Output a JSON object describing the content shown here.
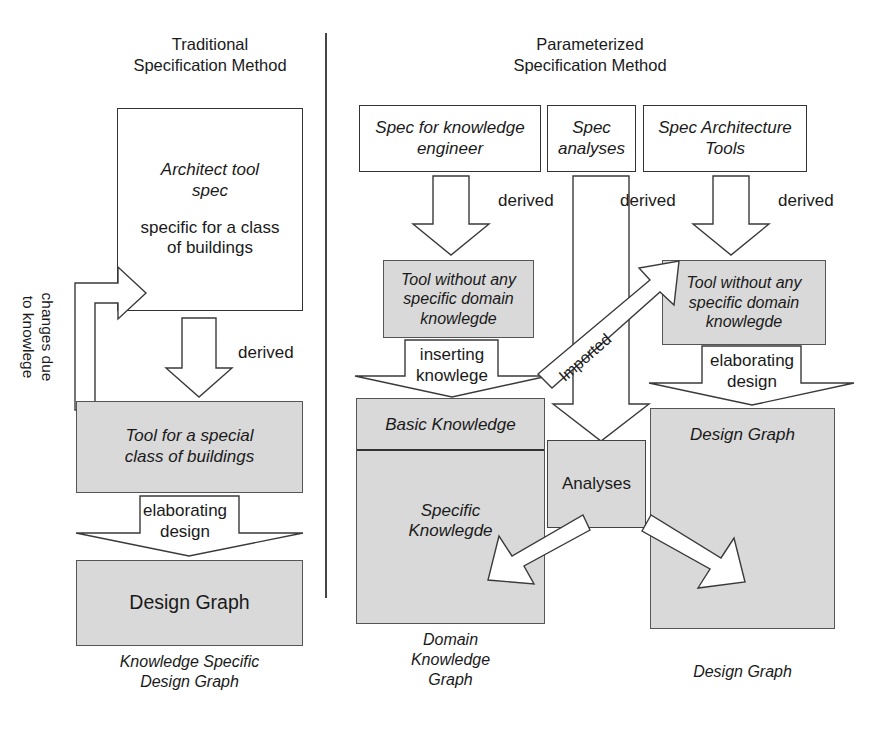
{
  "diagram": {
    "title_left": "Traditional\nSpecification Method",
    "title_right": "Parameterized\nSpecification Method",
    "colors": {
      "fill_gray": "#d9d9d9",
      "stroke": "#333333",
      "background": "#ffffff"
    }
  },
  "left_column": {
    "heading": "Traditional\nSpecification Method",
    "spec_box": {
      "line1": "Architect tool",
      "line2": "spec",
      "line3": "specific for a class",
      "line4": "of buildings"
    },
    "feedback_arrow_label": "changes due\nto knowlege",
    "derived_label": "derived",
    "tool_box": {
      "line1": "Tool for a special",
      "line2": "class of buildings"
    },
    "elaborating_label": "elaborating\ndesign",
    "design_graph_box": "Design Graph",
    "caption": "Knowledge Specific\nDesign Graph"
  },
  "right_column": {
    "heading": "Parameterized\nSpecification Method",
    "spec_boxes": [
      {
        "line1": "Spec for knowledge",
        "line2": "engineer"
      },
      {
        "line1": "Spec",
        "line2": "analyses"
      },
      {
        "line1": "Spec Architecture",
        "line2": "Tools"
      }
    ],
    "derived_labels": [
      "derived",
      "derived",
      "derived"
    ],
    "tool_box_left": {
      "line1": "Tool without any",
      "line2": "specific domain",
      "line3": "knowlegde"
    },
    "tool_box_right": {
      "line1": "Tool without any",
      "line2": "specific domain",
      "line3": "knowlegde"
    },
    "inserting_label": "inserting\nknowlege",
    "elaborating_label": "elaborating\ndesign",
    "imported_label": "Imported",
    "knowledge_box": {
      "basic": "Basic Knowledge",
      "specific_line1": "Specific",
      "specific_line2": "Knowlegde"
    },
    "analyses_box": "Analyses",
    "design_graph_box": "Design Graph",
    "caption_left": "Domain\nKnowledge\nGraph",
    "caption_right": "Design Graph"
  }
}
